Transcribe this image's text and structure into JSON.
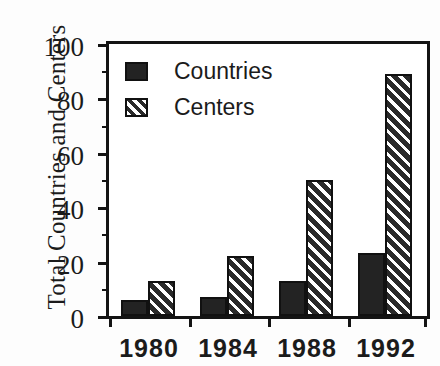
{
  "chart_data": {
    "type": "bar",
    "title": "",
    "subtitle": "",
    "xlabel": "",
    "ylabel": "Total Countries and Centers",
    "categories": [
      "1980",
      "1984",
      "1988",
      "1992"
    ],
    "series": [
      {
        "name": "Countries",
        "values": [
          6,
          7,
          13,
          23
        ],
        "fill": "solid",
        "color": "#232323"
      },
      {
        "name": "Centers",
        "values": [
          13,
          22,
          50,
          89
        ],
        "fill": "diagonal-hatch",
        "color": "#2a2a2a"
      }
    ],
    "ylim": [
      0,
      100
    ],
    "yticks": [
      0,
      20,
      40,
      60,
      80,
      100
    ],
    "ytick_labels": [
      "0",
      "20",
      "40",
      "60",
      "80",
      "100"
    ],
    "yminor_ticks": [
      10,
      30,
      50,
      70,
      90
    ],
    "grid": false,
    "legend_position": "top-left",
    "frame": "box",
    "annotations": []
  },
  "legend": {
    "items": [
      {
        "label": "Countries"
      },
      {
        "label": "Centers"
      }
    ]
  }
}
